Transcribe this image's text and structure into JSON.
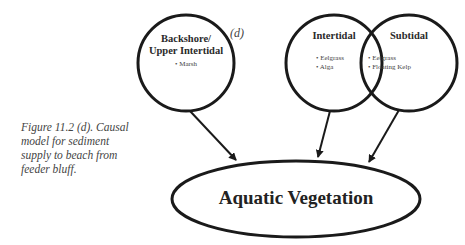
{
  "panel_label": "(d)",
  "caption": "Figure 11.2 (d). Causal model for sediment supply to beach from feeder bluff.",
  "nodes": {
    "backshore": {
      "title_line1": "Backshore/",
      "title_line2": "Upper Intertidal",
      "items": [
        "• Marsh"
      ]
    },
    "intertidal": {
      "title": "Intertidal",
      "items": [
        "• Eelgrass",
        "• Alga"
      ]
    },
    "subtidal": {
      "title": "Subtidal",
      "items": [
        "• Eelgrass",
        "• Floating Kelp"
      ]
    },
    "outcome": {
      "title": "Aquatic Vegetation"
    }
  },
  "edges": [
    {
      "from": "Backshore/Upper Intertidal",
      "to": "Aquatic Vegetation"
    },
    {
      "from": "Intertidal",
      "to": "Aquatic Vegetation"
    },
    {
      "from": "Subtidal",
      "to": "Aquatic Vegetation"
    }
  ],
  "colors": {
    "stroke": "#1a1a1a",
    "background": "#ffffff"
  }
}
